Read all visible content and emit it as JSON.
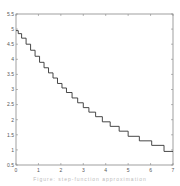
{
  "chart_data": {
    "type": "line",
    "step": true,
    "title": "",
    "xlabel": "",
    "ylabel": "",
    "xlim": [
      0,
      7
    ],
    "ylim": [
      0.5,
      5.5
    ],
    "xticks": [
      0,
      1,
      2,
      3,
      4,
      5,
      6,
      7
    ],
    "xtick_labels": [
      "0",
      "1",
      "2",
      "3",
      "4",
      "5",
      "6",
      "7"
    ],
    "yticks": [
      0.5,
      1,
      1.5,
      2,
      2.5,
      3,
      3.5,
      4,
      4.5,
      5,
      5.5
    ],
    "ytick_labels": [
      "0.5",
      "1",
      "1.5",
      "2",
      "2.5",
      "3",
      "3.5",
      "4",
      "4.5",
      "5",
      "5.5"
    ],
    "grid": false,
    "legend": null,
    "line_color": "#333333",
    "series": [
      {
        "name": "staircase",
        "x": [
          0.0,
          0.1,
          0.25,
          0.45,
          0.65,
          0.85,
          1.05,
          1.25,
          1.45,
          1.65,
          1.85,
          2.05,
          2.25,
          2.5,
          2.75,
          3.0,
          3.25,
          3.55,
          3.85,
          4.2,
          4.6,
          5.0,
          5.5,
          6.05,
          6.6,
          7.0
        ],
        "y": [
          4.95,
          4.85,
          4.7,
          4.5,
          4.3,
          4.1,
          3.9,
          3.72,
          3.55,
          3.38,
          3.2,
          3.05,
          2.9,
          2.72,
          2.56,
          2.4,
          2.25,
          2.1,
          1.93,
          1.78,
          1.62,
          1.45,
          1.3,
          1.15,
          0.95,
          0.95
        ]
      }
    ]
  },
  "caption": "Figure: step-function approximation"
}
